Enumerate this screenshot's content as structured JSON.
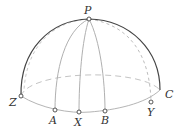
{
  "diagram": {
    "type": "hemisphere-geometry",
    "points": {
      "P": {
        "label": "P",
        "x": 89,
        "y": 19
      },
      "Z": {
        "label": "Z",
        "x": 21,
        "y": 96
      },
      "A": {
        "label": "A",
        "x": 55,
        "y": 110
      },
      "X": {
        "label": "X",
        "x": 79,
        "y": 112
      },
      "B": {
        "label": "B",
        "x": 105,
        "y": 111
      },
      "Y": {
        "label": "Y",
        "x": 151,
        "y": 102
      },
      "C": {
        "label": "C",
        "x": 160,
        "y": 90
      }
    },
    "labels": {
      "P": "P",
      "Z": "Z",
      "A": "A",
      "X": "X",
      "B": "B",
      "Y": "Y",
      "C": "C"
    },
    "colors": {
      "outer_arc": "#444444",
      "light_line": "#b0b0b0",
      "dashed_line": "#c0c0c0",
      "point_fill": "#ffffff",
      "point_stroke": "#444444",
      "label": "#333333"
    }
  }
}
